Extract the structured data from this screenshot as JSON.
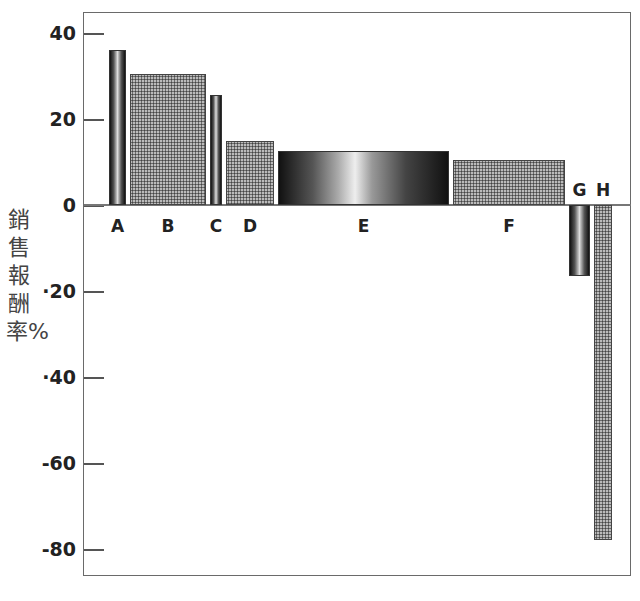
{
  "chart_data": {
    "type": "bar",
    "title": "",
    "xlabel": "",
    "ylabel": "銷售報酬率%",
    "ylim": [
      -85,
      45
    ],
    "yticks": [
      40,
      20,
      0,
      -20,
      -40,
      -60,
      -80
    ],
    "ytick_labels": [
      "40",
      "20",
      "0",
      "·20",
      "·40",
      "-60",
      "-80"
    ],
    "categories": [
      "A",
      "B",
      "C",
      "D",
      "E",
      "F",
      "G",
      "H"
    ],
    "values": [
      36,
      30.5,
      25.5,
      15,
      12.5,
      10.5,
      -16.5,
      -78
    ],
    "bar_widths_relative": [
      17,
      76,
      12,
      48,
      171,
      112,
      21,
      18
    ],
    "bar_styles": [
      "cylinder",
      "hatch",
      "cylinder",
      "hatch",
      "cylinder",
      "hatch",
      "cylinder",
      "hatch"
    ],
    "grid": false,
    "legend": null
  }
}
